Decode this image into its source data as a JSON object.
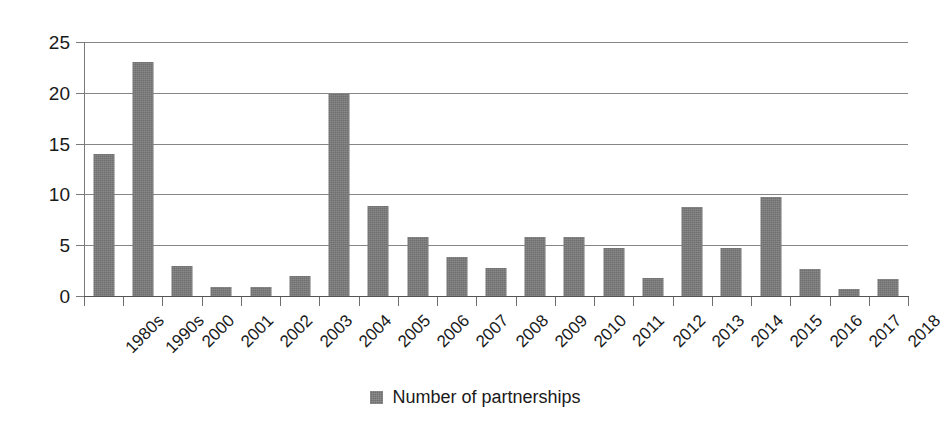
{
  "chart_data": {
    "type": "bar",
    "title": "",
    "subtitle": "",
    "xlabel": "",
    "ylabel": "",
    "ylim": [
      0,
      25
    ],
    "yticks": [
      0,
      5,
      10,
      15,
      20,
      25
    ],
    "grid": true,
    "legend_position": "bottom",
    "legend": [
      "Number of partnerships"
    ],
    "series_color": "#6f6f6f",
    "categories": [
      "1980s",
      "1990s",
      "2000",
      "2001",
      "2002",
      "2003",
      "2004",
      "2005",
      "2006",
      "2007",
      "2008",
      "2009",
      "2010",
      "2011",
      "2012",
      "2013",
      "2014",
      "2015",
      "2016",
      "2017",
      "2018"
    ],
    "series": [
      {
        "name": "Number of partnerships",
        "values": [
          14,
          23,
          3,
          0.9,
          0.9,
          2,
          19.9,
          8.9,
          5.8,
          3.8,
          2.8,
          5.8,
          5.8,
          4.7,
          1.8,
          8.8,
          4.7,
          9.7,
          2.7,
          0.7,
          1.7
        ]
      }
    ]
  },
  "legend": {
    "marker_name": "legend-color-swatch",
    "label": "Number of partnerships"
  }
}
